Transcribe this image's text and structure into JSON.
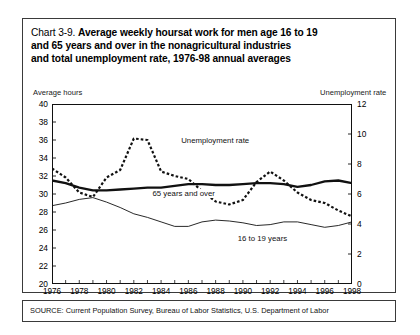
{
  "figure": {
    "title_prefix": "Chart 3-9. ",
    "title_line1": "Average weekly hoursat work for men age 16 to 19",
    "title_line2": "and 65 years and over in the nonagricultural industries",
    "title_line3": "and total unemployment rate, 1976-98 annual averages",
    "source": "SOURCE: Current Population Survey, Bureau of Labor Statistics, U.S. Department of Labor",
    "left_axis_caption": "Average hours",
    "right_axis_caption": "Unemployment rate"
  },
  "chart_data": {
    "type": "line",
    "title": "Chart 3-9. Average weekly hoursat work for men age 16 to 19 and 65 years and over in the nonagricultural industries and total unemployment rate, 1976-98 annual averages",
    "xlabel": "",
    "ylabel": "Average hours",
    "y2label": "Unemployment rate",
    "xlim": [
      1976,
      1998
    ],
    "ylim": [
      20,
      40
    ],
    "y2lim": [
      0,
      12
    ],
    "grid": false,
    "legend_position": "inline-annotations",
    "x": [
      1976,
      1977,
      1978,
      1979,
      1980,
      1981,
      1982,
      1983,
      1984,
      1985,
      1986,
      1987,
      1988,
      1989,
      1990,
      1991,
      1992,
      1993,
      1994,
      1995,
      1996,
      1997,
      1998
    ],
    "xticks": [
      1976,
      1978,
      1980,
      1982,
      1984,
      1986,
      1988,
      1990,
      1992,
      1994,
      1996,
      1998
    ],
    "xtick_labels": [
      "1976",
      "1978",
      "1980",
      "1982",
      "1984",
      "1986",
      "1988",
      "1990",
      "1992",
      "1994",
      "1996",
      "1998"
    ],
    "yticks": [
      20,
      22,
      24,
      26,
      28,
      30,
      32,
      34,
      36,
      38,
      40
    ],
    "ytick_labels": [
      "20",
      "22",
      "24",
      "26",
      "28",
      "30",
      "32",
      "34",
      "36",
      "38",
      "40"
    ],
    "y2ticks": [
      0,
      2,
      4,
      6,
      8,
      10,
      12
    ],
    "y2tick_labels": [
      "0",
      "2",
      "4",
      "6",
      "8",
      "10",
      "12"
    ],
    "series": [
      {
        "name": "Unemployment rate",
        "axis": "right",
        "style": "dotted",
        "linewidth": 2.2,
        "label_text": "Unemployment rate",
        "label_x": 1985.4,
        "label_y": 9.55,
        "units": "percent",
        "values": [
          7.7,
          7.1,
          6.1,
          5.8,
          7.1,
          7.6,
          9.7,
          9.6,
          7.5,
          7.2,
          7.0,
          6.2,
          5.5,
          5.3,
          5.6,
          6.8,
          7.5,
          6.9,
          6.1,
          5.6,
          5.4,
          4.9,
          4.5
        ]
      },
      {
        "name": "65 years and over",
        "axis": "left",
        "style": "solid-thick",
        "linewidth": 2.3,
        "label_text": "65 years and over",
        "label_x": 1983.3,
        "label_y": 30.05,
        "units": "average weekly hours",
        "values": [
          31.5,
          31.2,
          30.7,
          30.4,
          30.4,
          30.5,
          30.6,
          30.7,
          30.7,
          30.9,
          31.1,
          31.1,
          31.0,
          31.0,
          31.1,
          31.2,
          31.2,
          31.1,
          30.8,
          31.0,
          31.4,
          31.5,
          31.2
        ]
      },
      {
        "name": "16 to 19 years",
        "axis": "left",
        "style": "solid-thin",
        "linewidth": 0.9,
        "label_text": "16 to 19 years",
        "label_x": 1991.6,
        "label_y": 25.0,
        "units": "average weekly hours",
        "values": [
          28.7,
          29.0,
          29.4,
          29.6,
          29.1,
          28.5,
          27.8,
          27.4,
          26.9,
          26.4,
          26.4,
          26.9,
          27.1,
          27.0,
          26.8,
          26.5,
          26.6,
          26.9,
          26.9,
          26.6,
          26.3,
          26.5,
          26.9
        ]
      }
    ]
  }
}
